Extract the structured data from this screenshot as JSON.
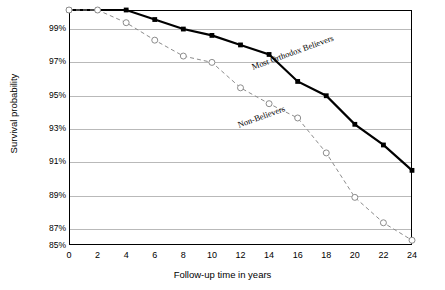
{
  "chart_data": {
    "type": "line",
    "title": "",
    "xlabel": "Follow-up time in years",
    "ylabel": "Survival probability",
    "x": [
      0,
      2,
      4,
      6,
      8,
      10,
      12,
      14,
      16,
      18,
      20,
      22,
      24
    ],
    "xtick_labels": [
      "0",
      "2",
      "4",
      "6",
      "8",
      "10",
      "12",
      "14",
      "16",
      "18",
      "20",
      "22",
      "24"
    ],
    "xlim": [
      0,
      24
    ],
    "ylim": [
      85,
      99.8
    ],
    "ytick_labels": [
      "85%",
      "87%",
      "89%",
      "91%",
      "93%",
      "95%",
      "97%",
      "99%"
    ],
    "ytick_values": [
      85,
      87,
      89,
      91,
      93,
      95,
      97,
      99
    ],
    "grid": true,
    "legend_position": "inline-annotation",
    "series": [
      {
        "name": "Most Orthodox Believers",
        "marker": "filled-square",
        "line_style": "solid",
        "color": "#000000",
        "values": [
          99.8,
          99.8,
          99.8,
          99.2,
          98.6,
          98.2,
          97.6,
          97.0,
          95.3,
          94.4,
          92.6,
          91.3,
          89.7
        ]
      },
      {
        "name": "Non-Believers",
        "marker": "open-circle",
        "line_style": "dashed",
        "color": "#8c8c8c",
        "values": [
          99.8,
          99.8,
          99.0,
          97.9,
          96.9,
          96.5,
          94.9,
          93.9,
          93.0,
          90.8,
          88.0,
          86.4,
          85.3
        ]
      }
    ]
  }
}
